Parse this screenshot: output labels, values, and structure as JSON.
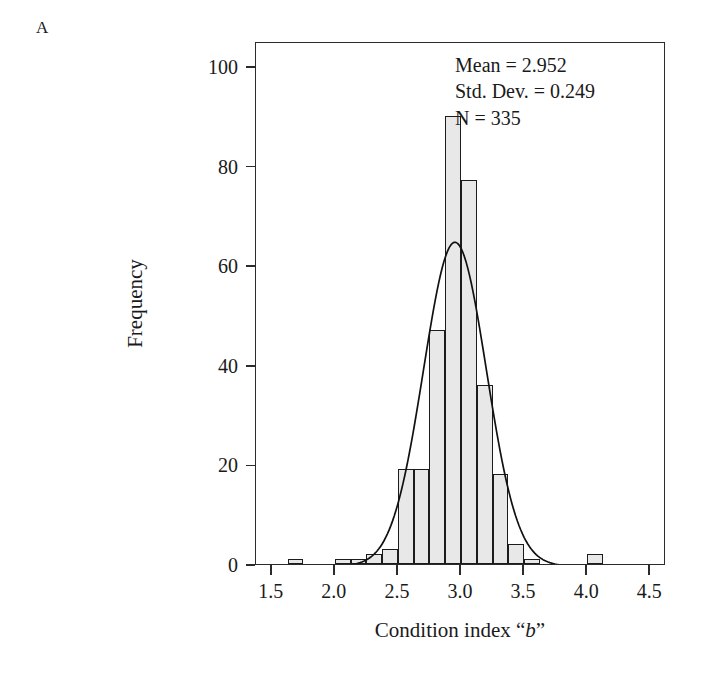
{
  "panel": {
    "letter": "A"
  },
  "annotation": {
    "mean_line": "Mean = 2.952",
    "sd_line": "Std. Dev. = 0.249",
    "n_line": "N = 335"
  },
  "axes": {
    "y_title": "Frequency",
    "x_title_prefix": "Condition index “",
    "x_title_italic": "b",
    "x_title_suffix": "”",
    "y_ticks": [
      "0",
      "20",
      "40",
      "60",
      "80",
      "100"
    ],
    "x_ticks": [
      "1.5",
      "2.0",
      "2.5",
      "3.0",
      "3.5",
      "4.0",
      "4.5"
    ]
  },
  "colors": {
    "bar_fill": "#e8e8e8",
    "bar_stroke": "#1c1c1c",
    "axis": "#2b2b2b",
    "text": "#1a1a1a",
    "curve": "#111111",
    "background": "#ffffff"
  },
  "chart_data": {
    "type": "bar",
    "title": "",
    "xlabel": "Condition index “b”",
    "ylabel": "Frequency",
    "xlim": [
      1.375,
      4.625
    ],
    "ylim": [
      0,
      105
    ],
    "grid": false,
    "legend": "none",
    "bin_width": 0.125,
    "annotations": [
      "Mean = 2.952",
      "Std. Dev. = 0.249",
      "N = 335"
    ],
    "bin_centers": [
      1.6875,
      1.8125,
      1.9375,
      2.0625,
      2.1875,
      2.3125,
      2.4375,
      2.5625,
      2.6875,
      2.8125,
      2.9375,
      3.0625,
      3.1875,
      3.3125,
      3.4375,
      3.5625,
      3.6875,
      3.8125,
      3.9375,
      4.0625,
      4.1875
    ],
    "values": [
      1,
      0,
      0,
      1,
      1,
      2,
      3,
      19,
      19,
      47,
      90,
      77,
      36,
      18,
      4,
      1,
      0,
      0,
      0,
      2,
      0
    ],
    "overlay": {
      "type": "line",
      "name": "normal curve",
      "mean": 2.952,
      "std_dev": 0.249,
      "n": 335,
      "peak_value": 65
    }
  }
}
